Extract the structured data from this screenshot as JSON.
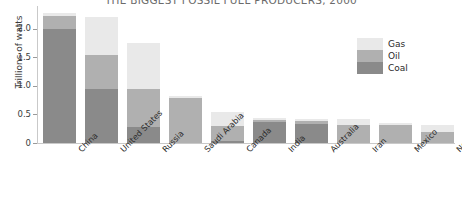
{
  "chart_data": {
    "type": "bar",
    "subtype": "stacked-bar",
    "title": "THE BIGGEST FOSSIL FUEL PRODUCERS, 2000",
    "xlabel": "",
    "ylabel": "Trillions of watts",
    "ylim": [
      0,
      2.4
    ],
    "yticks": [
      0,
      0.5,
      1.0,
      1.5,
      2.0
    ],
    "ytick_labels": [
      "0",
      "0.5",
      "1.0",
      "1.5",
      "2.0"
    ],
    "grid": false,
    "legend_position": "top-right",
    "categories": [
      "China",
      "United States",
      "Russia",
      "Saudi Arabia",
      "Canada",
      "India",
      "Australia",
      "Iran",
      "Mexico",
      "Norway"
    ],
    "series": [
      {
        "name": "Coal",
        "color": "#8a8a8a",
        "values": [
          2.0,
          0.95,
          0.28,
          0.0,
          0.03,
          0.36,
          0.33,
          0.0,
          0.0,
          0.0
        ]
      },
      {
        "name": "Oil",
        "color": "#b0b0b0",
        "values": [
          0.23,
          0.6,
          0.67,
          0.78,
          0.27,
          0.05,
          0.05,
          0.32,
          0.31,
          0.19
        ]
      },
      {
        "name": "Gas",
        "color": "#e9e9e9",
        "values": [
          0.05,
          0.65,
          0.8,
          0.05,
          0.25,
          0.02,
          0.04,
          0.1,
          0.04,
          0.13
        ]
      }
    ],
    "totals": [
      2.28,
      2.2,
      1.75,
      0.83,
      0.55,
      0.43,
      0.42,
      0.42,
      0.35,
      0.32
    ]
  },
  "legend": {
    "items": [
      {
        "label": "Gas",
        "color": "#e9e9e9"
      },
      {
        "label": "Oil",
        "color": "#b0b0b0"
      },
      {
        "label": "Coal",
        "color": "#8a8a8a"
      }
    ]
  },
  "axes": {
    "y_title": "Trillions of watts"
  }
}
